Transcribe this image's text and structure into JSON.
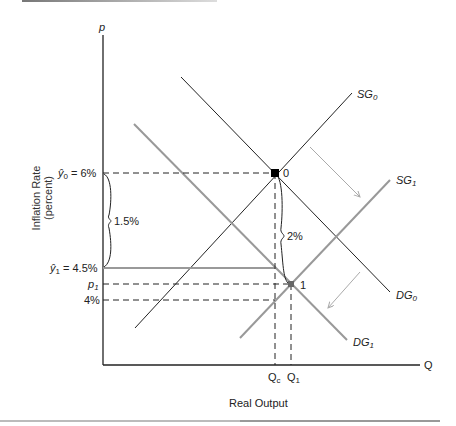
{
  "diagram": {
    "axes": {
      "y_axis_symbol": "p",
      "x_axis_symbol": "Q",
      "y_label_line1": "Inflation Rate",
      "y_label_line2": "(percent)",
      "x_label": "Real Output"
    },
    "curves": {
      "SG0": {
        "name": "SG",
        "sub": "0",
        "color": "#222222"
      },
      "SG1": {
        "name": "SG",
        "sub": "1",
        "color": "#999999"
      },
      "DG0": {
        "name": "DG",
        "sub": "0",
        "color": "#222222"
      },
      "DG1": {
        "name": "DG",
        "sub": "1",
        "color": "#999999"
      }
    },
    "y_ticks": {
      "y0": {
        "sym": "ŷ",
        "sub": "0",
        "value": "= 6%"
      },
      "y1": {
        "sym": "ŷ",
        "sub": "1",
        "value": "= 4.5%"
      },
      "p1": {
        "sym": "p",
        "sub": "1"
      },
      "four": "4%"
    },
    "x_ticks": {
      "qc": {
        "sym": "Q",
        "sub": "c"
      },
      "q1": {
        "sym": "Q",
        "sub": "1"
      }
    },
    "annotations": {
      "brace_left": "1.5%",
      "brace_mid": "2%",
      "point0": "0",
      "point1": "1"
    }
  }
}
